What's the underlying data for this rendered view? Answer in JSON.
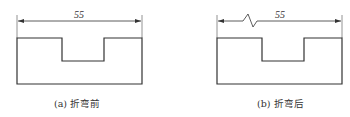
{
  "figures": [
    {
      "id": "a",
      "caption": "(a) 折弯前",
      "dimension": "55",
      "has_break_mark": false
    },
    {
      "id": "b",
      "caption": "(b) 折弯后",
      "dimension": "55",
      "has_break_mark": true
    }
  ],
  "colors": {
    "line": "#333333",
    "extension": "#777777"
  }
}
